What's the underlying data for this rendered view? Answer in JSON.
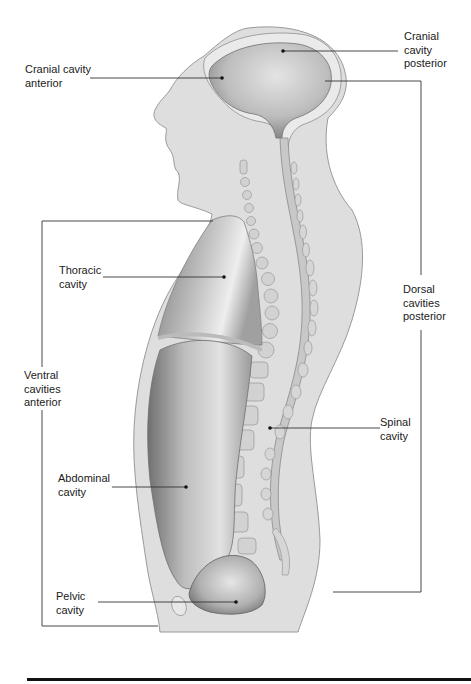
{
  "diagram": {
    "type": "anatomical sagittal section",
    "colors": {
      "body_fill": "#dcdcdc",
      "body_outline": "#9a9a9a",
      "cavity_dark": "#7a7a7a",
      "cavity_light": "#d8d8d8",
      "leader_line": "#333333",
      "bottom_rule": "#111111"
    },
    "labels": {
      "cranial_anterior": {
        "line1": "Cranial cavity",
        "line2": "anterior"
      },
      "cranial_posterior": {
        "line1": "Cranial",
        "line2": "cavity",
        "line3": "posterior"
      },
      "thoracic": {
        "line1": "Thoracic",
        "line2": "cavity"
      },
      "ventral": {
        "line1": "Ventral",
        "line2": "cavities",
        "line3": "anterior"
      },
      "abdominal": {
        "line1": "Abdominal",
        "line2": "cavity"
      },
      "pelvic": {
        "line1": "Pelvic",
        "line2": "cavity"
      },
      "dorsal": {
        "line1": "Dorsal",
        "line2": "cavities",
        "line3": "posterior"
      },
      "spinal": {
        "line1": "Spinal",
        "line2": "cavity"
      }
    }
  }
}
